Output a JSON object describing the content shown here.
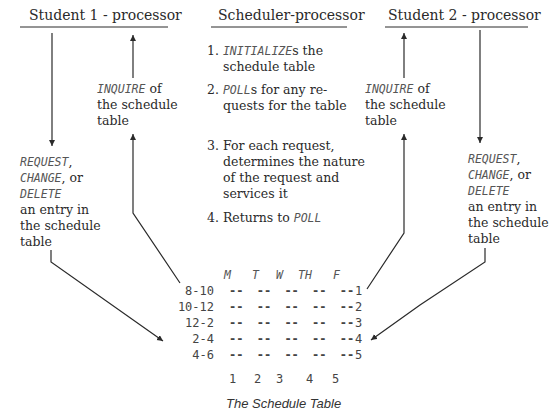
{
  "headers": {
    "student1": "Student 1 - processor",
    "scheduler": "Scheduler-processor",
    "student2": "Student 2 - processor"
  },
  "student1": {
    "inquire": {
      "cmd": "INQUIRE",
      "rest1": " of",
      "line2": "the schedule",
      "line3": "table"
    },
    "modify": {
      "cmd1": "REQUEST",
      "sep1": ",",
      "cmd2": "CHANGE",
      "sep2": ", or",
      "cmd3": "DELETE",
      "line4": "an entry in",
      "line5": "the schedule",
      "line6": "table"
    }
  },
  "student2": {
    "inquire": {
      "cmd": "INQUIRE",
      "rest1": " of",
      "line2": "the schedule",
      "line3": "table"
    },
    "modify": {
      "cmd1": "REQUEST",
      "sep1": ",",
      "cmd2": "CHANGE",
      "sep2": ", or",
      "cmd3": "DELETE",
      "line4": "an entry in",
      "line5": "the schedule",
      "line6": "table"
    }
  },
  "scheduler_steps": [
    {
      "num": "1.",
      "cmd": "INITIALIZE",
      "rest": "s the",
      "cont": [
        "schedule table"
      ]
    },
    {
      "num": "2.",
      "cmd": "POLL",
      "rest": "s for any re-",
      "cont": [
        "quests for the table"
      ]
    },
    {
      "num": "3.",
      "cmd": "",
      "rest": "For each request,",
      "cont": [
        "determines the nature",
        "of the request and",
        "services it"
      ]
    },
    {
      "num": "4.",
      "cmd": "",
      "rest": "Returns to ",
      "cmd_after": "POLL",
      "cont": []
    }
  ],
  "schedule_table": {
    "columns": [
      "M",
      "T",
      "W",
      "TH",
      "F"
    ],
    "rows": [
      "8-10",
      "10-12",
      "12-2",
      "2-4",
      "4-6"
    ],
    "cell": "--",
    "row_numbers": [
      "1",
      "2",
      "3",
      "4",
      "5"
    ],
    "column_numbers": [
      "1",
      "2",
      "3",
      "4",
      "5"
    ],
    "caption": "The Schedule Table"
  }
}
